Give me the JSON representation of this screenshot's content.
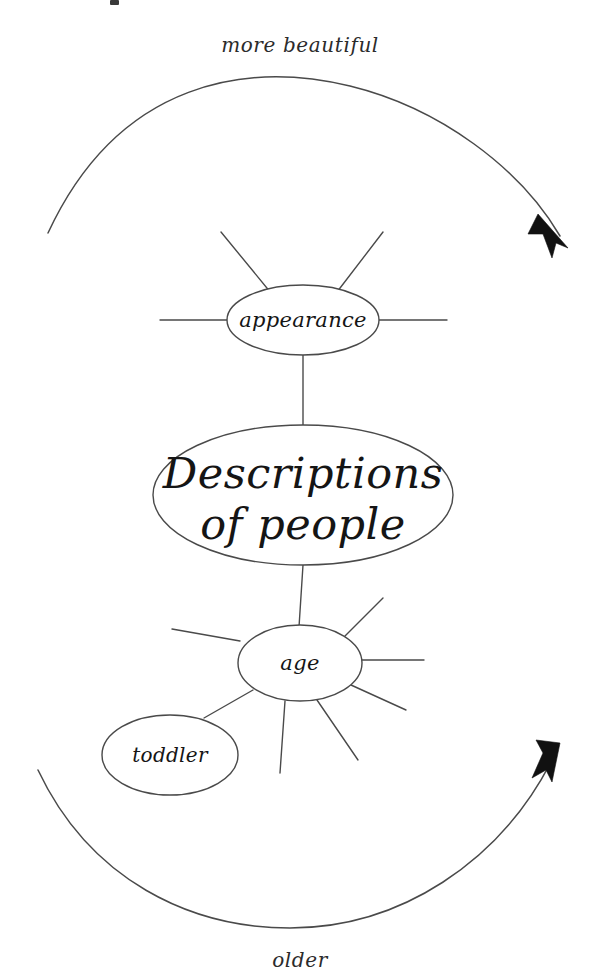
{
  "colors": {
    "background": "#ffffff",
    "stroke": "#4a4a4a",
    "text": "#151515",
    "arrow": "#111111"
  },
  "axis_labels": {
    "top": "more beautiful",
    "bottom": "older"
  },
  "nodes": {
    "center": {
      "label": "Descriptions of people",
      "line1": "Descriptions",
      "line2": "of people"
    },
    "appearance": {
      "label": "appearance",
      "spokes": 5
    },
    "age": {
      "label": "age",
      "spokes": 7
    },
    "toddler": {
      "label": "toddler"
    }
  },
  "arcs": {
    "top": {
      "direction": "clockwise-right",
      "label": "more beautiful"
    },
    "bottom": {
      "direction": "clockwise-right",
      "label": "older"
    }
  }
}
